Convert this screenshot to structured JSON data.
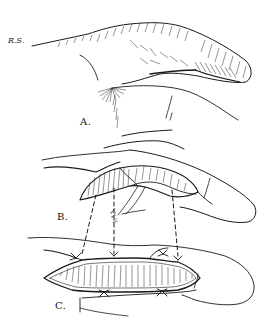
{
  "figure": {
    "ink_color": "#1a1a1a",
    "background": "#ffffff",
    "signature": "R.S.",
    "panels": [
      {
        "id": "A",
        "label": "A.",
        "subject": "finger with raised dorsal skin flap attached to adjacent finger"
      },
      {
        "id": "B",
        "label": "B.",
        "subject": "flap elevated showing raw undersurface with suture stitches"
      },
      {
        "id": "C",
        "label": "C.",
        "subject": "flap sutured into defect with dashed lines indicating suture correspondence"
      }
    ]
  }
}
